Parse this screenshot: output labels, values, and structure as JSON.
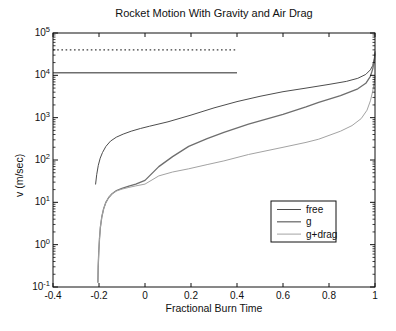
{
  "chart_data": {
    "type": "line",
    "title": "Rocket Motion With Gravity and Air Drag",
    "xlabel": "Fractional Burn Time",
    "ylabel": "v (m/sec)",
    "grid": false,
    "x_axis": {
      "min": -0.4,
      "max": 1,
      "scale": "linear",
      "ticks": [
        -0.4,
        -0.2,
        0,
        0.2,
        0.4,
        0.6,
        0.8,
        1
      ],
      "tick_labels": [
        "-0.4",
        "-0.2",
        "0",
        "0.2",
        "0.4",
        "0.6",
        "0.8",
        "1"
      ]
    },
    "y_axis": {
      "min": 0.1,
      "max": 100000,
      "scale": "log",
      "tick_base": "10",
      "tick_exponents": [
        -1,
        0,
        1,
        2,
        3,
        4,
        5
      ],
      "minor_ticks": true
    },
    "legend": {
      "position": "inside-lower-right",
      "entries": [
        "free",
        "g",
        "g+drag"
      ]
    },
    "reference_lines": [
      {
        "name": "dashed-reference-line",
        "v": 40000,
        "t_start": -0.4,
        "t_end": 0.4,
        "style": "dashed",
        "color": "#3d3d3d",
        "width": 1.2
      },
      {
        "name": "solid-reference-line",
        "v": 11500,
        "t_start": -0.4,
        "t_end": 0.4,
        "style": "solid",
        "color": "#6e6e6e",
        "width": 1.4
      }
    ],
    "series": [
      {
        "name": "free",
        "color": "#4d4d4d",
        "width": 1,
        "points": [
          [
            -0.215,
            27
          ],
          [
            -0.21,
            45
          ],
          [
            -0.203,
            75
          ],
          [
            -0.195,
            110
          ],
          [
            -0.185,
            150
          ],
          [
            -0.17,
            210
          ],
          [
            -0.15,
            280
          ],
          [
            -0.125,
            345
          ],
          [
            -0.095,
            410
          ],
          [
            -0.06,
            480
          ],
          [
            -0.02,
            555
          ],
          [
            0.02,
            630
          ],
          [
            0.1,
            800
          ],
          [
            0.2,
            1150
          ],
          [
            0.3,
            1700
          ],
          [
            0.4,
            2400
          ],
          [
            0.5,
            3200
          ],
          [
            0.6,
            4100
          ],
          [
            0.7,
            5000
          ],
          [
            0.8,
            6100
          ],
          [
            0.875,
            7200
          ],
          [
            0.925,
            8500
          ],
          [
            0.96,
            10500
          ],
          [
            0.98,
            13500
          ],
          [
            0.99,
            17000
          ],
          [
            0.997,
            25000
          ],
          [
            1,
            36000
          ]
        ]
      },
      {
        "name": "g",
        "color": "#6e6e6e",
        "width": 1.3,
        "points": [
          [
            -0.205,
            0.13
          ],
          [
            -0.2035,
            0.3
          ],
          [
            -0.201,
            0.7
          ],
          [
            -0.198,
            1.4
          ],
          [
            -0.194,
            2.6
          ],
          [
            -0.188,
            4.5
          ],
          [
            -0.18,
            7
          ],
          [
            -0.17,
            10
          ],
          [
            -0.158,
            13
          ],
          [
            -0.143,
            16
          ],
          [
            -0.124,
            19
          ],
          [
            -0.1,
            21.5
          ],
          [
            -0.07,
            24
          ],
          [
            -0.04,
            27
          ],
          [
            0,
            33
          ],
          [
            0.06,
            70
          ],
          [
            0.12,
            120
          ],
          [
            0.19,
            210
          ],
          [
            0.27,
            320
          ],
          [
            0.343,
            450
          ],
          [
            0.45,
            700
          ],
          [
            0.6,
            1200
          ],
          [
            0.7,
            1800
          ],
          [
            0.755,
            2300
          ],
          [
            0.85,
            3300
          ],
          [
            0.925,
            4800
          ],
          [
            0.96,
            6500
          ],
          [
            0.98,
            9500
          ],
          [
            0.99,
            14000
          ],
          [
            0.997,
            22000
          ],
          [
            1,
            32000
          ]
        ]
      },
      {
        "name": "g+drag",
        "color": "#a3a3a3",
        "width": 1,
        "points": [
          [
            -0.205,
            0.13
          ],
          [
            -0.2035,
            0.3
          ],
          [
            -0.201,
            0.7
          ],
          [
            -0.198,
            1.4
          ],
          [
            -0.194,
            2.6
          ],
          [
            -0.188,
            4.5
          ],
          [
            -0.18,
            7
          ],
          [
            -0.17,
            10
          ],
          [
            -0.158,
            13
          ],
          [
            -0.143,
            16
          ],
          [
            -0.124,
            18.5
          ],
          [
            -0.1,
            20.5
          ],
          [
            -0.07,
            22.5
          ],
          [
            -0.04,
            24.5
          ],
          [
            0,
            27
          ],
          [
            0.06,
            42
          ],
          [
            0.12,
            52
          ],
          [
            0.19,
            62
          ],
          [
            0.27,
            78
          ],
          [
            0.343,
            95
          ],
          [
            0.45,
            135
          ],
          [
            0.6,
            200
          ],
          [
            0.7,
            260
          ],
          [
            0.755,
            310
          ],
          [
            0.85,
            480
          ],
          [
            0.9,
            650
          ],
          [
            0.94,
            950
          ],
          [
            0.965,
            1500
          ],
          [
            0.98,
            2500
          ],
          [
            0.99,
            4200
          ],
          [
            0.997,
            7000
          ],
          [
            1,
            9500
          ]
        ]
      }
    ],
    "colors": {
      "axis": "#111111",
      "text": "#111111",
      "background": "#ffffff"
    }
  }
}
